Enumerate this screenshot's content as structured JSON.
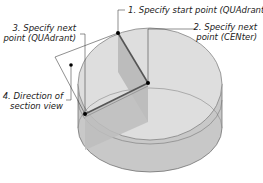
{
  "diagram": {
    "type": "cylinder-section-view",
    "callouts": [
      {
        "step": "1",
        "text": "1. Specify start point (QUAdrant)"
      },
      {
        "step": "2",
        "line1": "2. Specify next",
        "line2": "point (CENter)"
      },
      {
        "step": "3",
        "line1": "3. Specify next",
        "line2": "point (QUAdrant)"
      },
      {
        "step": "4",
        "line1": "4. Direction of",
        "line2": "section view"
      }
    ],
    "colors": {
      "top_face": "#dcdcdc",
      "side_face": "#c4c4c4",
      "cut_face": "#b0b0b0",
      "outline": "#555555",
      "leader": "#444444",
      "point": "#000000"
    }
  }
}
